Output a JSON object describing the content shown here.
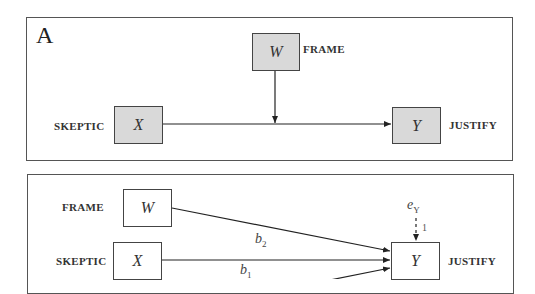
{
  "panel_a": {
    "letter": "A",
    "nodes": {
      "W": {
        "symbol": "W",
        "label": "FRAME"
      },
      "X": {
        "symbol": "X",
        "label": "SKEPTIC"
      },
      "Y": {
        "symbol": "Y",
        "label": "JUSTIFY"
      }
    }
  },
  "panel_b": {
    "nodes": {
      "W": {
        "symbol": "W",
        "label": "FRAME"
      },
      "X": {
        "symbol": "X",
        "label": "SKEPTIC"
      },
      "Y": {
        "symbol": "Y",
        "label": "JUSTIFY"
      }
    },
    "error": {
      "symbol": "e",
      "subscript": "Y",
      "path_value": "1"
    },
    "paths": [
      {
        "from": "W",
        "to": "Y",
        "coef": "b",
        "subscript": "2"
      },
      {
        "from": "X",
        "to": "Y",
        "coef": "b",
        "subscript": "1"
      }
    ]
  },
  "colors": {
    "shaded_fill": "#d9d9d9",
    "border": "#444444",
    "line": "#222222"
  }
}
